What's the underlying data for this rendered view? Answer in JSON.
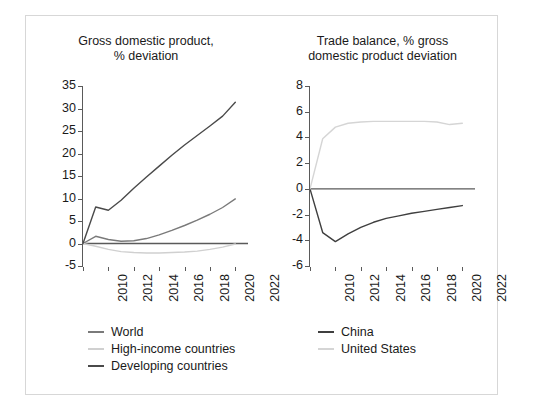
{
  "colors": {
    "world": "#7a7a7a",
    "high_income": "#d0d0d0",
    "developing": "#4a4a4a",
    "china": "#3f3f3f",
    "united_states": "#d5d5d5",
    "axis": "#5a5a5a",
    "text": "#1a1a1a",
    "frame": "#d7d7d7",
    "background": "#ffffff"
  },
  "chart_data": [
    {
      "type": "line",
      "title": "Gross domestic product, % deviation",
      "title_line1": "Gross domestic product,",
      "title_line2": "% deviation",
      "xlabel": "",
      "ylabel": "",
      "xlim": [
        2010,
        2023
      ],
      "ylim": [
        -5,
        35
      ],
      "ytick_labels": [
        "35",
        "30",
        "25",
        "20",
        "15",
        "10",
        "5",
        "0",
        "-5"
      ],
      "yticks": [
        35,
        30,
        25,
        20,
        15,
        10,
        5,
        0,
        -5
      ],
      "xtick_labels": [
        "2010",
        "2012",
        "2014",
        "2016",
        "2018",
        "2020",
        "2022"
      ],
      "xticks": [
        2010,
        2012,
        2014,
        2016,
        2018,
        2020,
        2022
      ],
      "grid": false,
      "legend_position": "below",
      "x": [
        2010,
        2011,
        2012,
        2013,
        2014,
        2015,
        2016,
        2017,
        2018,
        2019,
        2020,
        2021,
        2022
      ],
      "series": [
        {
          "name": "World",
          "color": "#7a7a7a",
          "values": [
            0,
            1.6,
            0.9,
            0.5,
            0.6,
            1.1,
            1.9,
            2.9,
            4.0,
            5.2,
            6.5,
            8.0,
            9.9
          ]
        },
        {
          "name": "High-income countries",
          "color": "#d0d0d0",
          "values": [
            0,
            -0.6,
            -1.3,
            -1.8,
            -2.0,
            -2.1,
            -2.1,
            -2.0,
            -1.9,
            -1.7,
            -1.3,
            -0.8,
            -0.1
          ]
        },
        {
          "name": "Developing countries",
          "color": "#4a4a4a",
          "values": [
            0,
            8.1,
            7.4,
            9.6,
            12.3,
            14.8,
            17.2,
            19.6,
            21.9,
            24.0,
            26.1,
            28.3,
            31.4
          ]
        }
      ]
    },
    {
      "type": "line",
      "title": "Trade balance, % gross domestic product deviation",
      "title_line1": "Trade balance, % gross",
      "title_line2": "domestic product deviation",
      "xlabel": "",
      "ylabel": "",
      "xlim": [
        2010,
        2023
      ],
      "ylim": [
        -6,
        8
      ],
      "ytick_labels": [
        "8",
        "6",
        "4",
        "2",
        "0",
        "-2",
        "-4",
        "-6"
      ],
      "yticks": [
        8,
        6,
        4,
        2,
        0,
        -2,
        -4,
        -6
      ],
      "xtick_labels": [
        "2010",
        "2012",
        "2014",
        "2016",
        "2018",
        "2020",
        "2022"
      ],
      "xticks": [
        2010,
        2012,
        2014,
        2016,
        2018,
        2020,
        2022
      ],
      "grid": false,
      "legend_position": "below",
      "x": [
        2010,
        2011,
        2012,
        2013,
        2014,
        2015,
        2016,
        2017,
        2018,
        2019,
        2020,
        2021,
        2022
      ],
      "series": [
        {
          "name": "China",
          "color": "#3f3f3f",
          "values": [
            0,
            -3.4,
            -4.1,
            -3.5,
            -3.0,
            -2.6,
            -2.3,
            -2.1,
            -1.9,
            -1.75,
            -1.6,
            -1.45,
            -1.3
          ]
        },
        {
          "name": "United States",
          "color": "#d5d5d5",
          "values": [
            0,
            3.9,
            4.8,
            5.1,
            5.2,
            5.25,
            5.25,
            5.25,
            5.25,
            5.25,
            5.2,
            5.0,
            5.1
          ]
        }
      ]
    }
  ],
  "left_legend": [
    {
      "label": "World",
      "color": "#7a7a7a"
    },
    {
      "label": "High-income countries",
      "color": "#d0d0d0"
    },
    {
      "label": "Developing countries",
      "color": "#4a4a4a"
    }
  ],
  "right_legend": [
    {
      "label": "China",
      "color": "#3f3f3f"
    },
    {
      "label": "United States",
      "color": "#d5d5d5"
    }
  ]
}
